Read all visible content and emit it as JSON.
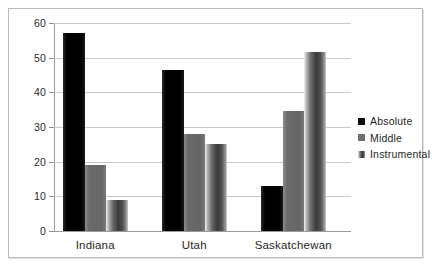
{
  "chart_data": {
    "type": "bar",
    "title": "",
    "subtitle": "",
    "xlabel": "",
    "ylabel": "",
    "categories": [
      "Indiana",
      "Utah",
      "Saskatchewan"
    ],
    "series": [
      {
        "name": "Absolute",
        "color": "#0d0d0d",
        "values": [
          57,
          46.5,
          13
        ]
      },
      {
        "name": "Middle",
        "color": "#6e6e6e",
        "values": [
          19,
          28,
          34.5
        ]
      },
      {
        "name": "Instrumental",
        "color": "#4f4f4f",
        "values": [
          9,
          25,
          51.5
        ]
      }
    ],
    "ylim": [
      0,
      60
    ],
    "yticks": [
      0,
      10,
      20,
      30,
      40,
      50,
      60
    ],
    "ytick_labels": [
      "0",
      "10",
      "20",
      "30",
      "40",
      "50",
      "60"
    ],
    "grid": true,
    "grid_axis": "y",
    "legend": true,
    "legend_position": "right"
  },
  "legend": {
    "entries": [
      {
        "label": "Absolute"
      },
      {
        "label": "Middle"
      },
      {
        "label": "Instrumental"
      }
    ]
  }
}
